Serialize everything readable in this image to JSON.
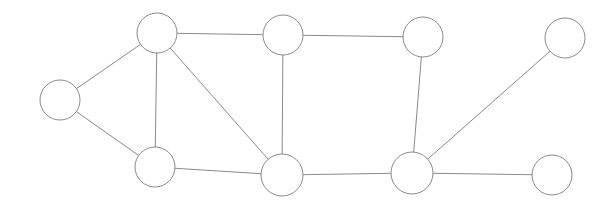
{
  "canvas": {
    "width": 614,
    "height": 210,
    "background": "#ffffff"
  },
  "graph": {
    "title": "Undirected node-link graph",
    "node_count": 9,
    "edge_count": 12,
    "style": {
      "node_fill": "#ffffff",
      "node_stroke": "#8a8a8a",
      "node_stroke_width": 1,
      "edge_stroke": "#8a8a8a",
      "edge_stroke_width": 1,
      "node_radius": 20
    },
    "nodes": [
      {
        "id": "n0",
        "label": "",
        "cx": 60,
        "cy": 100,
        "r": 20,
        "role": "leaf-left"
      },
      {
        "id": "n1",
        "label": "",
        "cx": 157,
        "cy": 33,
        "r": 20,
        "role": "upper-left-hub"
      },
      {
        "id": "n2",
        "label": "",
        "cx": 283,
        "cy": 35,
        "r": 20,
        "role": "upper-middle"
      },
      {
        "id": "n3",
        "label": "",
        "cx": 423,
        "cy": 37,
        "r": 20,
        "role": "upper-right"
      },
      {
        "id": "n4",
        "label": "",
        "cx": 565,
        "cy": 38,
        "r": 20,
        "role": "leaf-top-right"
      },
      {
        "id": "n5",
        "label": "",
        "cx": 155,
        "cy": 167,
        "r": 20,
        "role": "lower-left"
      },
      {
        "id": "n6",
        "label": "",
        "cx": 282,
        "cy": 175,
        "r": 21,
        "role": "lower-middle-hub"
      },
      {
        "id": "n7",
        "label": "",
        "cx": 412,
        "cy": 173,
        "r": 21,
        "role": "lower-right-hub"
      },
      {
        "id": "n8",
        "label": "",
        "cx": 552,
        "cy": 175,
        "r": 20,
        "role": "leaf-bottom-right"
      }
    ],
    "edges": [
      {
        "id": "e0",
        "source": "n0",
        "target": "n1"
      },
      {
        "id": "e1",
        "source": "n0",
        "target": "n5"
      },
      {
        "id": "e2",
        "source": "n1",
        "target": "n2"
      },
      {
        "id": "e3",
        "source": "n1",
        "target": "n5"
      },
      {
        "id": "e4",
        "source": "n1",
        "target": "n6"
      },
      {
        "id": "e5",
        "source": "n2",
        "target": "n3"
      },
      {
        "id": "e6",
        "source": "n2",
        "target": "n6"
      },
      {
        "id": "e7",
        "source": "n3",
        "target": "n7"
      },
      {
        "id": "e8",
        "source": "n5",
        "target": "n6"
      },
      {
        "id": "e9",
        "source": "n6",
        "target": "n7"
      },
      {
        "id": "e10",
        "source": "n7",
        "target": "n4"
      },
      {
        "id": "e11",
        "source": "n7",
        "target": "n8"
      }
    ]
  }
}
